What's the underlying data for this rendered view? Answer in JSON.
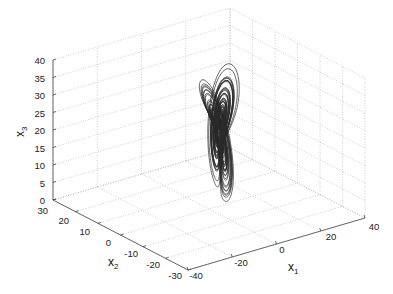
{
  "chart_data": {
    "type": "line",
    "subtype": "3d-trajectory",
    "title": "",
    "axes": {
      "x1": {
        "label": "x",
        "subscript": "1",
        "ticks": [
          -40,
          -20,
          0,
          20,
          40
        ],
        "range": [
          -40,
          40
        ]
      },
      "x2": {
        "label": "x",
        "subscript": "2",
        "ticks": [
          -30,
          -20,
          -10,
          0,
          10,
          20,
          30
        ],
        "range": [
          -30,
          30
        ]
      },
      "x3": {
        "label": "x",
        "subscript": "3",
        "ticks": [
          0,
          5,
          10,
          15,
          20,
          25,
          30,
          35,
          40
        ],
        "range": [
          0,
          40
        ]
      }
    },
    "grid": true,
    "box": false,
    "legend": null,
    "series": [
      {
        "name": "trajectory",
        "color": "#2a2a2a",
        "approx_extent": {
          "x1": [
            -15,
            25
          ],
          "x2": [
            -20,
            15
          ],
          "x3": [
            0,
            40
          ]
        }
      }
    ]
  },
  "labels": {
    "x1_tick_labels": [
      "-40",
      "-20",
      "0",
      "20",
      "40"
    ],
    "x2_tick_labels": [
      "30",
      "20",
      "10",
      "0",
      "-10",
      "-20",
      "-30"
    ],
    "x3_tick_labels": [
      "40",
      "35",
      "30",
      "25",
      "20",
      "15",
      "10",
      "5",
      "0"
    ],
    "x1_label": "x",
    "x1_sub": "1",
    "x2_label": "x",
    "x2_sub": "2",
    "x3_label": "x",
    "x3_sub": "3"
  }
}
